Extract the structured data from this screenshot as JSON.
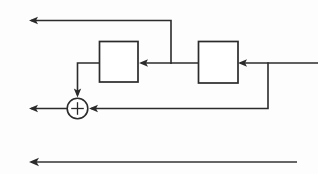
{
  "diagram": {
    "type": "block-diagram",
    "canvas": {
      "width": 318,
      "height": 174,
      "background": "#fdfdfd"
    },
    "stroke_color": "#2b2b2b",
    "blocks": [
      {
        "id": "block-left",
        "label": "",
        "x": 99,
        "y": 41,
        "width": 39,
        "height": 41
      },
      {
        "id": "block-right",
        "label": "",
        "x": 198,
        "y": 41,
        "width": 40,
        "height": 42
      }
    ],
    "summing_junction": {
      "id": "summing-junction",
      "label": "+",
      "cx": 77.5,
      "cy": 108.5,
      "r": 10.5
    },
    "signals": [
      {
        "id": "output-top",
        "name": "top-output-arrow",
        "description": "Tap from mid bus routed up then left off-canvas",
        "path": "M171,64 L171,20 L31,20",
        "arrow_at": {
          "x": 29,
          "y": 20,
          "dir": "left"
        }
      },
      {
        "id": "input-right",
        "name": "right-input-arrow",
        "description": "Input entering right block from right edge",
        "path": "M318,63 L240,63",
        "arrow_at": {
          "x": 238,
          "y": 63,
          "dir": "left"
        }
      },
      {
        "id": "interblock",
        "name": "right-to-left-block-arrow",
        "description": "Right block output feeding left block input",
        "path": "M198,63 L141,63",
        "arrow_at": {
          "x": 139,
          "y": 63,
          "dir": "left"
        }
      },
      {
        "id": "to-summer",
        "name": "left-block-to-summer-arrow",
        "description": "Left block output routed left then down into summer",
        "path": "M99,63 L77.5,63 L77.5,95",
        "arrow_at": {
          "x": 77.5,
          "y": 97,
          "dir": "down"
        }
      },
      {
        "id": "feedback-lower",
        "name": "feedback-to-summer-arrow",
        "description": "Tap at right bus routed down then left into summer",
        "path": "M268,63 L268,108.5 L91,108.5",
        "arrow_at": {
          "x": 89,
          "y": 108.5,
          "dir": "left"
        }
      },
      {
        "id": "output-summer",
        "name": "summer-output-arrow",
        "description": "Summer output leaving to the left",
        "path": "M67,108.5 L31,108.5",
        "arrow_at": {
          "x": 29,
          "y": 108.5,
          "dir": "left"
        }
      },
      {
        "id": "output-bottom",
        "name": "bottom-output-arrow",
        "description": "Long bottom bus arrow pointing left",
        "path": "M297,162 L31,162",
        "arrow_at": {
          "x": 29,
          "y": 162,
          "dir": "left"
        }
      }
    ],
    "junction_dots": [
      {
        "id": "tap-mid",
        "x": 171,
        "y": 63
      },
      {
        "id": "tap-right",
        "x": 268,
        "y": 63
      }
    ]
  }
}
